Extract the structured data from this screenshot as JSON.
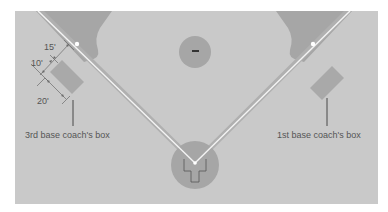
{
  "diagram": {
    "labels": {
      "third_base_box": "3rd base coach's box",
      "first_base_box": "1st base coach's box"
    },
    "dimensions": {
      "d15": "15'",
      "d10": "10'",
      "d20": "20'"
    },
    "colors": {
      "background": "#ffffff",
      "grass": "#c9c9c9",
      "dirt": "#a6a6a6",
      "box_fill": "#a9a9a9",
      "foul_line": "#f4f4f4",
      "dim_line": "#6a6a6a",
      "pointer_line": "#3a3a3a",
      "text": "#555555"
    }
  }
}
